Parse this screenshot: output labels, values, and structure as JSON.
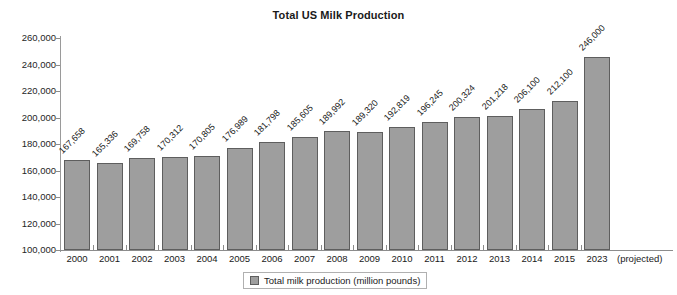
{
  "chart_data": {
    "type": "bar",
    "title": "Total US Milk Production",
    "xlabel": "",
    "ylabel": "",
    "ylim": [
      100000,
      260000
    ],
    "ytick_step": 20000,
    "ytick_labels": [
      "260,000",
      "240,000",
      "220,000",
      "200,000",
      "180,000",
      "160,000",
      "140,000",
      "120,000",
      "100,000"
    ],
    "grid": false,
    "legend_position": "bottom-center",
    "bar_color": "#9e9e9e",
    "bar_border_color": "#5e5e5e",
    "categories": [
      "2000",
      "2001",
      "2002",
      "2003",
      "2004",
      "2005",
      "2006",
      "2007",
      "2008",
      "2009",
      "2010",
      "2011",
      "2012",
      "2013",
      "2014",
      "2015",
      "2023"
    ],
    "values": [
      167658,
      165336,
      169758,
      170312,
      170805,
      176989,
      181798,
      185605,
      189992,
      189320,
      192819,
      196245,
      200324,
      201218,
      206100,
      212100,
      246000
    ],
    "value_labels": [
      "167,658",
      "165,336",
      "169,758",
      "170,312",
      "170,805",
      "176,989",
      "181,798",
      "185,605",
      "189,992",
      "189,320",
      "192,819",
      "196,245",
      "200,324",
      "201,218",
      "206,100",
      "212,100",
      "246,000"
    ],
    "annotation_last_category": "(projected)",
    "series": [
      {
        "name": "Total milk production (million pounds)",
        "values": [
          167658,
          165336,
          169758,
          170312,
          170805,
          176989,
          181798,
          185605,
          189992,
          189320,
          192819,
          196245,
          200324,
          201218,
          206100,
          212100,
          246000
        ]
      }
    ]
  },
  "legend": {
    "label": "Total milk production (million pounds)",
    "swatch": "legend-swatch"
  }
}
